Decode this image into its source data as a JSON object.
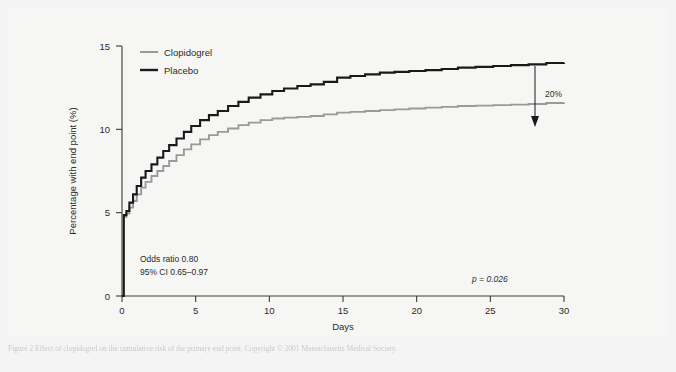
{
  "figure": {
    "background_color": "#f6f6f5",
    "caption_text": "Figure 2 Effect of clopidogrel on the cumulative risk of the primary end point. Copyright © 2001 Massachusetts Medical Society."
  },
  "chart_data": {
    "type": "line",
    "title": "",
    "xlabel": "Days",
    "ylabel": "Percentage with end point (%)",
    "xlim": [
      0,
      30
    ],
    "ylim": [
      0,
      15
    ],
    "xticks": [
      0,
      5,
      10,
      15,
      20,
      25,
      30
    ],
    "yticks": [
      0,
      5,
      10,
      15
    ],
    "xtick_labels": [
      "0",
      "5",
      "10",
      "15",
      "20",
      "25",
      "30"
    ],
    "ytick_labels": [
      "0",
      "5",
      "10",
      "15"
    ],
    "grid": false,
    "legend_position": "top-left",
    "series": [
      {
        "name": "Clopidogrel",
        "color": "#9a9a9a",
        "x": [
          0,
          0.12,
          0.3,
          0.5,
          0.75,
          1.0,
          1.3,
          1.6,
          2.0,
          2.4,
          2.8,
          3.2,
          3.7,
          4.2,
          4.7,
          5.3,
          5.9,
          6.5,
          7.2,
          7.9,
          8.6,
          9.4,
          10.2,
          11.0,
          11.9,
          12.8,
          13.7,
          14.6,
          15.5,
          16.5,
          17.5,
          18.5,
          19.5,
          20.6,
          21.7,
          22.8,
          24.0,
          25.2,
          26.4,
          27.6,
          28.8,
          30.0
        ],
        "y": [
          0.0,
          4.75,
          4.95,
          5.3,
          5.7,
          6.1,
          6.5,
          6.85,
          7.2,
          7.5,
          7.8,
          8.1,
          8.45,
          8.8,
          9.1,
          9.4,
          9.65,
          9.85,
          10.05,
          10.25,
          10.4,
          10.55,
          10.65,
          10.7,
          10.75,
          10.8,
          10.9,
          11.0,
          11.05,
          11.1,
          11.15,
          11.2,
          11.25,
          11.3,
          11.35,
          11.4,
          11.42,
          11.45,
          11.48,
          11.52,
          11.58,
          11.6
        ]
      },
      {
        "name": "Placebo",
        "color": "#1a1a1a",
        "x": [
          0,
          0.12,
          0.3,
          0.5,
          0.75,
          1.0,
          1.3,
          1.6,
          2.0,
          2.4,
          2.8,
          3.2,
          3.7,
          4.2,
          4.7,
          5.3,
          5.9,
          6.5,
          7.2,
          7.9,
          8.6,
          9.4,
          10.2,
          11.0,
          11.9,
          12.8,
          13.7,
          14.6,
          15.5,
          16.5,
          17.5,
          18.5,
          19.5,
          20.6,
          21.7,
          22.8,
          24.0,
          25.2,
          26.4,
          27.6,
          28.8,
          30.0
        ],
        "y": [
          0.0,
          4.85,
          5.1,
          5.6,
          6.1,
          6.6,
          7.1,
          7.5,
          7.9,
          8.3,
          8.7,
          9.05,
          9.45,
          9.85,
          10.2,
          10.55,
          10.85,
          11.1,
          11.4,
          11.65,
          11.9,
          12.1,
          12.3,
          12.45,
          12.6,
          12.7,
          12.85,
          13.1,
          13.2,
          13.3,
          13.4,
          13.45,
          13.5,
          13.55,
          13.62,
          13.7,
          13.75,
          13.8,
          13.85,
          13.9,
          13.98,
          14.0
        ]
      }
    ],
    "annotations": [
      {
        "id": "odds-ratio",
        "text": "Odds ratio 0.80",
        "x": 1.2,
        "y": 2.2
      },
      {
        "id": "confidence-interval",
        "text": "95% CI 0.65–0.97",
        "x": 1.2,
        "y": 1.5
      },
      {
        "id": "p-value",
        "text": "p = 0.026",
        "x": 24.2,
        "y": 1.6,
        "italic_first_char": true
      },
      {
        "id": "reduction-label",
        "text": "20%",
        "x": 28.0,
        "y": 12.6
      }
    ]
  },
  "legend": {
    "items": [
      {
        "label": "Clopidogrel",
        "color": "#9a9a9a"
      },
      {
        "label": "Placebo",
        "color": "#1a1a1a"
      }
    ]
  }
}
